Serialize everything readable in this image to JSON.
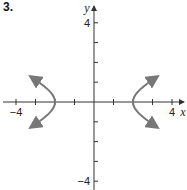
{
  "problem": {
    "number": "3."
  },
  "chart_data": {
    "type": "line",
    "title": "",
    "xlabel": "x",
    "ylabel": "y",
    "xlim": [
      -4.5,
      4.6
    ],
    "ylim": [
      -4.5,
      4.9
    ],
    "grid": false,
    "x_ticks": [
      -4,
      -3,
      -2,
      -1,
      1,
      2,
      3,
      4
    ],
    "y_ticks": [
      -4,
      -3,
      -2,
      -1,
      1,
      2,
      3,
      4
    ],
    "x_tick_labels": {
      "-4": "−4",
      "4": "4"
    },
    "y_tick_labels": {
      "4": "4",
      "-4": "−4"
    },
    "curve": {
      "equation": "x^2/4 - y^2 = 1",
      "type": "hyperbola",
      "vertices": [
        [
          -2,
          0
        ],
        [
          2,
          0
        ]
      ],
      "y_range": [
        -1.25,
        1.25
      ]
    },
    "series": [
      {
        "name": "left branch",
        "points": [
          [
            -3.08,
            1.25
          ],
          [
            -2.5,
            0.75
          ],
          [
            -2.12,
            0.35
          ],
          [
            -2,
            0
          ],
          [
            -2.12,
            -0.35
          ],
          [
            -2.5,
            -0.75
          ],
          [
            -3.08,
            -1.25
          ]
        ]
      },
      {
        "name": "right branch",
        "points": [
          [
            3.08,
            1.25
          ],
          [
            2.5,
            0.75
          ],
          [
            2.12,
            0.35
          ],
          [
            2,
            0
          ],
          [
            2.12,
            -0.35
          ],
          [
            2.5,
            -0.75
          ],
          [
            3.08,
            -1.25
          ]
        ]
      }
    ],
    "colors": {
      "axis": "#333333",
      "curve": "#777777"
    }
  }
}
